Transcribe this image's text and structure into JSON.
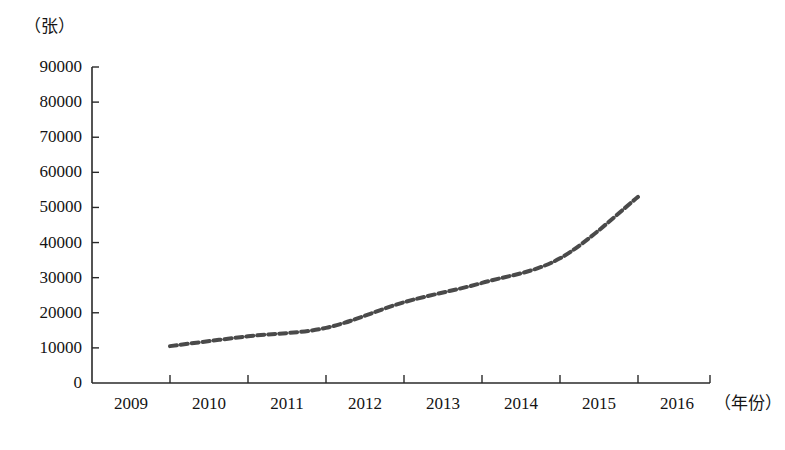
{
  "chart_data": {
    "type": "line",
    "title": "",
    "xlabel": "（年份）",
    "ylabel": "（张）",
    "x": [
      2009,
      2010,
      2011,
      2012,
      2013,
      2014,
      2015,
      2016
    ],
    "categories": [
      "2009",
      "2010",
      "2011",
      "2012",
      "2013",
      "2014",
      "2015",
      "2016"
    ],
    "series": [
      {
        "name": "",
        "x": [
          2010,
          2011,
          2012,
          2013,
          2014,
          2015,
          2016
        ],
        "values": [
          10500,
          13300,
          15700,
          23000,
          28500,
          35500,
          53000
        ],
        "style": "dashed",
        "color": "#4a4a4a",
        "line_width": 4,
        "dash_pattern": "7 4",
        "markers": false
      }
    ],
    "ylim": [
      0,
      90000
    ],
    "yticks": [
      0,
      10000,
      20000,
      30000,
      40000,
      50000,
      60000,
      70000,
      80000,
      90000
    ],
    "ytick_labels": [
      "0",
      "10000",
      "20000",
      "30000",
      "40000",
      "50000",
      "60000",
      "70000",
      "80000",
      "90000"
    ],
    "xticks": [
      2009,
      2010,
      2011,
      2012,
      2013,
      2014,
      2015,
      2016
    ],
    "xtick_labels_centered_between_ticks": true,
    "grid": false,
    "legend": null,
    "axis_color": "#2a2a2a",
    "background": "#ffffff"
  },
  "axes": {
    "y_unit": "（张）",
    "x_unit": "（年份）",
    "y_ticks": [
      {
        "label": "90000",
        "value": 90000
      },
      {
        "label": "80000",
        "value": 80000
      },
      {
        "label": "70000",
        "value": 70000
      },
      {
        "label": "60000",
        "value": 60000
      },
      {
        "label": "50000",
        "value": 50000
      },
      {
        "label": "40000",
        "value": 40000
      },
      {
        "label": "30000",
        "value": 30000
      },
      {
        "label": "20000",
        "value": 20000
      },
      {
        "label": "10000",
        "value": 10000
      },
      {
        "label": "0",
        "value": 0
      }
    ],
    "x_ticks": [
      {
        "label": "2009",
        "value": 2009
      },
      {
        "label": "2010",
        "value": 2010
      },
      {
        "label": "2011",
        "value": 2011
      },
      {
        "label": "2012",
        "value": 2012
      },
      {
        "label": "2013",
        "value": 2013
      },
      {
        "label": "2014",
        "value": 2014
      },
      {
        "label": "2015",
        "value": 2015
      },
      {
        "label": "2016",
        "value": 2016
      }
    ]
  },
  "colors": {
    "line": "#4a4a4a",
    "axis": "#2a2a2a",
    "text": "#141414",
    "background": "#ffffff"
  }
}
